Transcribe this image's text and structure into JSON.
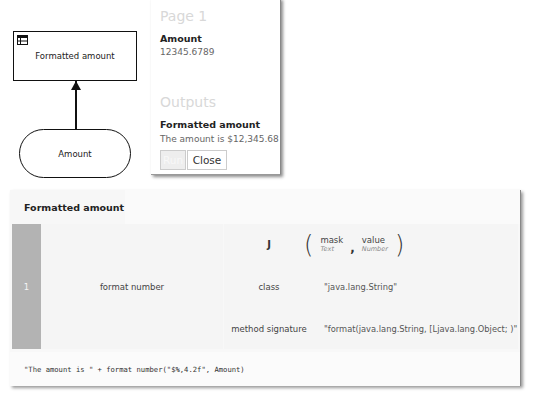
{
  "diagram": {
    "decision_node": {
      "label": "Formatted amount",
      "icon": "decision-table-icon"
    },
    "input_node": {
      "label": "Amount"
    },
    "connector": "information-requirement-arrow"
  },
  "run_popup": {
    "page_title": "Page 1",
    "inputs": [
      {
        "label": "Amount",
        "value": "12345.6789"
      }
    ],
    "outputs_title": "Outputs",
    "outputs": [
      {
        "label": "Formatted amount",
        "value": "The amount is $12,345.68"
      }
    ],
    "buttons": {
      "run": "Run",
      "close": "Close"
    }
  },
  "logic_panel": {
    "title": "Formatted amount",
    "rows": [
      {
        "number": "1",
        "name": "format number"
      }
    ],
    "invocation": {
      "kind": "J",
      "parameters": [
        {
          "name": "mask",
          "type": "Text"
        },
        {
          "name": "value",
          "type": "Number"
        }
      ],
      "separator": ",",
      "entries": [
        {
          "key": "class",
          "value": "\"java.lang.String\""
        },
        {
          "key": "method signature",
          "value": "\"format(java.lang.String, [Ljava.lang.Object; )\""
        }
      ]
    },
    "expression": "\"The amount is \" + format number(\"$%,4.2f\", Amount)"
  },
  "colors": {
    "row_number_bg": "#b3b3b3",
    "panel_bg": "#f5f5f5",
    "border": "#111111",
    "muted_heading": "#d8d8d8"
  }
}
